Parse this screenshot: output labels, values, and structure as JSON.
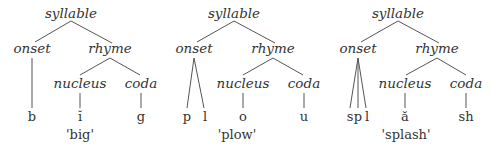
{
  "trees": [
    {
      "word": "'big'",
      "labels": {
        "root": "syllable",
        "onset": "onset",
        "rhyme": "rhyme",
        "nucleus": "nucleus",
        "coda": "coda"
      },
      "onset_segments": [
        "b"
      ],
      "nucleus_segment": "ĭ",
      "coda_segment": "g"
    },
    {
      "word": "'plow'",
      "labels": {
        "root": "syllable",
        "onset": "onset",
        "rhyme": "rhyme",
        "nucleus": "nucleus",
        "coda": "coda"
      },
      "onset_segments": [
        "p",
        "l"
      ],
      "nucleus_segment": "o",
      "coda_segment": "u"
    },
    {
      "word": "'splash'",
      "labels": {
        "root": "syllable",
        "onset": "onset",
        "rhyme": "rhyme",
        "nucleus": "nucleus",
        "coda": "coda"
      },
      "onset_segments": [
        "s",
        "p",
        "l"
      ],
      "nucleus_segment": "ă",
      "coda_segment": "sh"
    }
  ]
}
